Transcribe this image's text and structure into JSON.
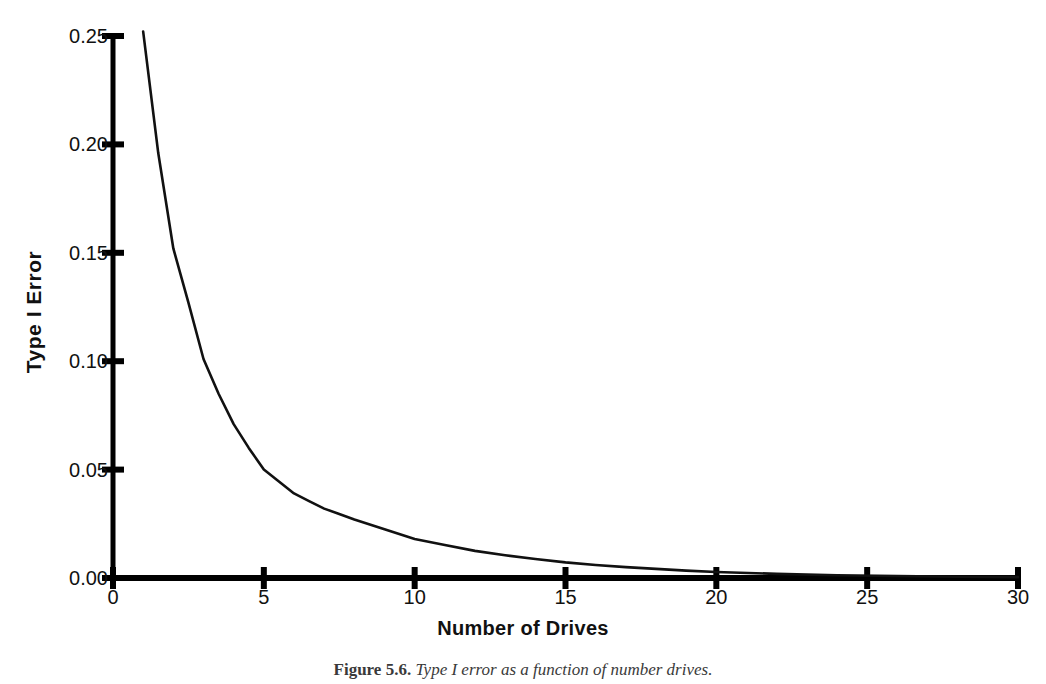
{
  "figure": {
    "caption_label": "Figure 5.6.",
    "caption_text": "Type I error as a function of number drives."
  },
  "chart_data": {
    "type": "line",
    "title": "",
    "xlabel": "Number of Drives",
    "ylabel": "Type I Error",
    "xlim": [
      0,
      30
    ],
    "ylim": [
      0.0,
      0.25
    ],
    "xticks": [
      0,
      5,
      10,
      15,
      20,
      25,
      30
    ],
    "xtick_labels": [
      "0",
      "5",
      "10",
      "15",
      "20",
      "25",
      "30"
    ],
    "yticks": [
      0.0,
      0.05,
      0.1,
      0.15,
      0.2,
      0.25
    ],
    "ytick_labels": [
      "0.00",
      "0.05",
      "0.10",
      "0.15",
      "0.20",
      "0.25"
    ],
    "grid": false,
    "legend": false,
    "line_color": "#111111",
    "axis_color": "#000000",
    "series": [
      {
        "name": "Type I Error",
        "x": [
          1,
          1.5,
          2,
          2.5,
          3,
          3.5,
          4,
          4.5,
          5,
          5.5,
          6,
          6.5,
          7,
          7.5,
          8,
          9,
          10,
          11,
          12,
          13,
          14,
          15,
          16,
          17,
          18,
          19,
          20,
          22,
          24,
          26,
          28,
          30
        ],
        "y": [
          0.252,
          0.196,
          0.152,
          0.127,
          0.101,
          0.085,
          0.071,
          0.06,
          0.05,
          0.0445,
          0.039,
          0.0355,
          0.032,
          0.0295,
          0.027,
          0.0225,
          0.018,
          0.0152,
          0.0125,
          0.0105,
          0.0088,
          0.0072,
          0.006,
          0.005,
          0.0042,
          0.0034,
          0.0028,
          0.0019,
          0.0013,
          0.0009,
          0.0006,
          0.0004
        ]
      }
    ]
  }
}
